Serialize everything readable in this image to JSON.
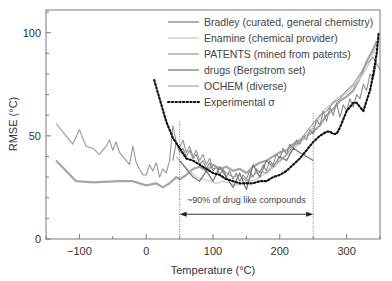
{
  "chart_data": {
    "type": "line",
    "title": "",
    "xlabel": "Temperature (°C)",
    "ylabel": "RMSE (°C)",
    "xlim": [
      -150,
      350
    ],
    "ylim": [
      0,
      111
    ],
    "xticks": [
      -100,
      0,
      100,
      200,
      300
    ],
    "xtick_labels": [
      "−100",
      "0",
      "100",
      "200",
      "300"
    ],
    "yticks": [
      0,
      50,
      100
    ],
    "ytick_labels": [
      "0",
      "50",
      "100"
    ],
    "grid": false,
    "legend_position": "upper right",
    "series": [
      {
        "name": "Bradley (curated, general chemistry)",
        "color": "#a6a6a6",
        "width": 2.2,
        "dash": "",
        "points": [
          [
            -135,
            38
          ],
          [
            -105,
            28
          ],
          [
            -80,
            27.5
          ],
          [
            -40,
            28
          ],
          [
            -20,
            28
          ],
          [
            0,
            26
          ],
          [
            15,
            27
          ],
          [
            25,
            25
          ],
          [
            35,
            27
          ],
          [
            45,
            30
          ],
          [
            50,
            29
          ],
          [
            60,
            31
          ],
          [
            70,
            34
          ],
          [
            80,
            35
          ],
          [
            90,
            33
          ],
          [
            100,
            36
          ],
          [
            110,
            34
          ],
          [
            120,
            35
          ],
          [
            130,
            33
          ],
          [
            140,
            34
          ],
          [
            150,
            32
          ],
          [
            160,
            35
          ],
          [
            170,
            37
          ],
          [
            180,
            38
          ],
          [
            190,
            40
          ],
          [
            200,
            42
          ],
          [
            210,
            43
          ],
          [
            220,
            46
          ],
          [
            230,
            48
          ],
          [
            240,
            50
          ],
          [
            250,
            52
          ],
          [
            260,
            55
          ],
          [
            270,
            60
          ],
          [
            280,
            63
          ],
          [
            290,
            67
          ],
          [
            300,
            69
          ],
          [
            310,
            72
          ],
          [
            320,
            78
          ],
          [
            330,
            86
          ],
          [
            340,
            92
          ],
          [
            345,
            96
          ]
        ]
      },
      {
        "name": "Enamine (chemical provider)",
        "color": "#cccccc",
        "width": 1.4,
        "dash": "",
        "points": [
          [
            45,
            40
          ],
          [
            55,
            36
          ],
          [
            65,
            33
          ],
          [
            75,
            30
          ],
          [
            85,
            29
          ],
          [
            95,
            28
          ],
          [
            105,
            27
          ],
          [
            115,
            28
          ],
          [
            125,
            27
          ],
          [
            135,
            26
          ],
          [
            145,
            27
          ],
          [
            155,
            28
          ],
          [
            165,
            29
          ],
          [
            175,
            31
          ],
          [
            185,
            33
          ],
          [
            195,
            36
          ],
          [
            205,
            39
          ],
          [
            215,
            42
          ],
          [
            225,
            45
          ],
          [
            235,
            48
          ],
          [
            245,
            52
          ],
          [
            255,
            56
          ],
          [
            265,
            62
          ],
          [
            275,
            65
          ],
          [
            285,
            68
          ],
          [
            295,
            70
          ],
          [
            305,
            72
          ],
          [
            315,
            76
          ],
          [
            325,
            80
          ],
          [
            335,
            86
          ],
          [
            345,
            94
          ]
        ]
      },
      {
        "name": "PATENTS (mined from patents)",
        "color": "#8c8c8c",
        "width": 1.1,
        "dash": "",
        "points": [
          [
            40,
            38
          ],
          [
            45,
            47
          ],
          [
            50,
            42
          ],
          [
            55,
            44
          ],
          [
            60,
            40
          ],
          [
            65,
            43
          ],
          [
            70,
            39
          ],
          [
            75,
            41
          ],
          [
            80,
            36
          ],
          [
            85,
            38
          ],
          [
            90,
            34
          ],
          [
            95,
            37
          ],
          [
            100,
            33
          ],
          [
            105,
            35
          ],
          [
            110,
            31
          ],
          [
            115,
            34
          ],
          [
            120,
            30
          ],
          [
            125,
            33
          ],
          [
            130,
            29
          ],
          [
            135,
            32
          ],
          [
            140,
            28
          ],
          [
            145,
            31
          ],
          [
            150,
            29
          ],
          [
            155,
            33
          ],
          [
            160,
            30
          ],
          [
            165,
            34
          ],
          [
            170,
            32
          ],
          [
            175,
            36
          ],
          [
            180,
            33
          ],
          [
            185,
            38
          ],
          [
            190,
            36
          ],
          [
            195,
            41
          ],
          [
            200,
            39
          ],
          [
            205,
            44
          ],
          [
            210,
            41
          ],
          [
            215,
            46
          ],
          [
            220,
            44
          ],
          [
            225,
            48
          ],
          [
            230,
            46
          ],
          [
            235,
            50
          ],
          [
            240,
            48
          ],
          [
            245,
            53
          ],
          [
            250,
            51
          ],
          [
            255,
            58
          ],
          [
            260,
            55
          ],
          [
            265,
            62
          ],
          [
            270,
            57
          ],
          [
            275,
            64
          ],
          [
            280,
            60
          ],
          [
            285,
            66
          ],
          [
            290,
            59
          ],
          [
            295,
            65
          ],
          [
            300,
            62
          ],
          [
            305,
            68
          ],
          [
            310,
            64
          ],
          [
            315,
            70
          ],
          [
            320,
            68
          ],
          [
            325,
            75
          ],
          [
            330,
            72
          ],
          [
            335,
            80
          ],
          [
            340,
            78
          ],
          [
            345,
            86
          ]
        ]
      },
      {
        "name": "drugs (Bergstrom set)",
        "color": "#737373",
        "width": 1.2,
        "dash": "",
        "points": [
          [
            50,
            38
          ],
          [
            60,
            34
          ],
          [
            70,
            30
          ],
          [
            80,
            28
          ],
          [
            90,
            33
          ],
          [
            100,
            28
          ],
          [
            110,
            35
          ],
          [
            120,
            30
          ],
          [
            130,
            25
          ],
          [
            140,
            32
          ],
          [
            150,
            24
          ],
          [
            160,
            36
          ],
          [
            170,
            30
          ],
          [
            180,
            38
          ],
          [
            190,
            35
          ],
          [
            200,
            40
          ],
          [
            210,
            38
          ],
          [
            220,
            44
          ],
          [
            230,
            42
          ],
          [
            240,
            40
          ],
          [
            250,
            38
          ]
        ]
      },
      {
        "name": "OCHEM (diverse)",
        "color": "#999999",
        "width": 1.1,
        "dash": "",
        "points": [
          [
            -135,
            56
          ],
          [
            -120,
            50
          ],
          [
            -110,
            46
          ],
          [
            -100,
            53
          ],
          [
            -90,
            45
          ],
          [
            -80,
            44
          ],
          [
            -70,
            41
          ],
          [
            -60,
            45
          ],
          [
            -55,
            48
          ],
          [
            -50,
            43
          ],
          [
            -45,
            47
          ],
          [
            -40,
            42
          ],
          [
            -30,
            38
          ],
          [
            -25,
            36
          ],
          [
            -20,
            45
          ],
          [
            -15,
            37
          ],
          [
            -10,
            34
          ],
          [
            -5,
            31
          ],
          [
            0,
            31
          ],
          [
            5,
            36
          ],
          [
            10,
            33
          ],
          [
            15,
            37
          ],
          [
            20,
            30
          ],
          [
            25,
            34
          ],
          [
            30,
            32
          ],
          [
            35,
            38
          ],
          [
            40,
            55
          ],
          [
            45,
            47
          ],
          [
            50,
            44
          ],
          [
            55,
            48
          ],
          [
            60,
            42
          ],
          [
            65,
            45
          ],
          [
            70,
            40
          ],
          [
            75,
            43
          ],
          [
            80,
            38
          ],
          [
            85,
            41
          ],
          [
            90,
            36
          ],
          [
            95,
            39
          ],
          [
            100,
            34
          ],
          [
            110,
            35
          ],
          [
            120,
            32
          ],
          [
            130,
            30
          ],
          [
            140,
            31
          ],
          [
            150,
            28
          ],
          [
            160,
            31
          ],
          [
            170,
            33
          ],
          [
            180,
            32
          ],
          [
            190,
            36
          ],
          [
            200,
            38
          ],
          [
            210,
            41
          ],
          [
            220,
            45
          ],
          [
            230,
            47
          ],
          [
            240,
            52
          ],
          [
            250,
            56
          ],
          [
            260,
            60
          ],
          [
            270,
            62
          ],
          [
            280,
            66
          ],
          [
            290,
            68
          ],
          [
            300,
            72
          ],
          [
            310,
            75
          ],
          [
            320,
            80
          ],
          [
            330,
            85
          ],
          [
            340,
            88
          ],
          [
            350,
            82
          ]
        ]
      },
      {
        "name": "Experimental σ",
        "color": "#111111",
        "width": 2.2,
        "dash": "1.5,2.2",
        "points": [
          [
            12,
            77
          ],
          [
            20,
            68
          ],
          [
            30,
            57
          ],
          [
            40,
            49
          ],
          [
            50,
            44
          ],
          [
            60,
            39
          ],
          [
            70,
            38
          ],
          [
            80,
            36
          ],
          [
            90,
            34
          ],
          [
            100,
            32
          ],
          [
            110,
            31
          ],
          [
            120,
            29
          ],
          [
            130,
            28
          ],
          [
            140,
            27
          ],
          [
            150,
            27
          ],
          [
            160,
            27
          ],
          [
            170,
            28
          ],
          [
            180,
            28
          ],
          [
            190,
            30
          ],
          [
            200,
            31
          ],
          [
            210,
            33
          ],
          [
            220,
            36
          ],
          [
            230,
            39
          ],
          [
            240,
            43
          ],
          [
            250,
            47
          ],
          [
            260,
            50
          ],
          [
            270,
            52
          ],
          [
            275,
            52
          ],
          [
            280,
            51
          ],
          [
            285,
            51
          ],
          [
            290,
            54
          ],
          [
            295,
            58
          ],
          [
            300,
            62
          ],
          [
            305,
            64
          ],
          [
            310,
            66
          ],
          [
            315,
            66
          ],
          [
            320,
            64
          ],
          [
            325,
            62
          ],
          [
            330,
            67
          ],
          [
            335,
            72
          ],
          [
            340,
            80
          ],
          [
            345,
            90
          ],
          [
            348,
            100
          ]
        ]
      }
    ],
    "annotations": [
      {
        "type": "vline",
        "x": 50,
        "y_top": 57,
        "style": "dotted"
      },
      {
        "type": "vline",
        "x": 250,
        "y_top": 61,
        "style": "dotted"
      },
      {
        "type": "double-arrow",
        "x1": 50,
        "x2": 250,
        "y": 12
      },
      {
        "type": "text",
        "text": "~90% of drug like compounds",
        "x": 150,
        "y": 19
      }
    ]
  },
  "legend": {
    "items": [
      {
        "label": "Bradley (curated, general chemistry)"
      },
      {
        "label": "Enamine (chemical provider)"
      },
      {
        "label": "PATENTS (mined from patents)"
      },
      {
        "label": "drugs (Bergstrom set)"
      },
      {
        "label": "OCHEM (diverse)"
      },
      {
        "label": "Experimental σ"
      }
    ]
  },
  "annotation_label": "~90% of drug like compounds",
  "axes": {
    "xlabel": "Temperature (°C)",
    "ylabel": "RMSE (°C)"
  }
}
